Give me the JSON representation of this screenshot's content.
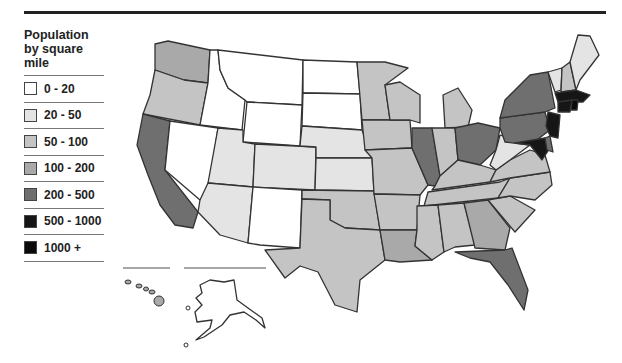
{
  "legend": {
    "title_line1": "Population",
    "title_line2": "by square",
    "title_line3": "mile",
    "items": [
      {
        "label": "0 - 20",
        "color": "#ffffff"
      },
      {
        "label": "20 - 50",
        "color": "#e4e4e4"
      },
      {
        "label": "50 - 100",
        "color": "#c4c4c4"
      },
      {
        "label": "100 - 200",
        "color": "#a9a9a9"
      },
      {
        "label": "200 - 500",
        "color": "#6f6f6f"
      },
      {
        "label": "500 - 1000",
        "color": "#161616"
      },
      {
        "label": "1000 +",
        "color": "#0a0a0a"
      }
    ]
  },
  "map": {
    "title": "United States population density by state",
    "insets": [
      "Hawaii",
      "Alaska"
    ]
  }
}
